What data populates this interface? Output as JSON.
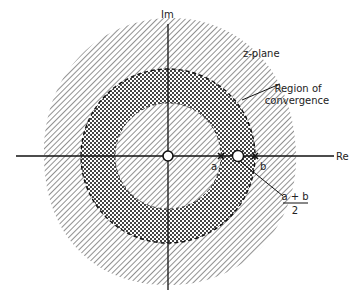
{
  "diagram": {
    "plane_label": "z-plane",
    "axis_labels": {
      "imag": "Im",
      "real": "Re"
    },
    "region_label_line1": "Region of",
    "region_label_line2": "convergence",
    "point_a": "a",
    "point_b": "b",
    "midpoint_numerator": "a + b",
    "midpoint_denominator": "2",
    "regions": [
      {
        "name": "inner-disk",
        "pattern": "diagonal-hatch",
        "radius_label": "a"
      },
      {
        "name": "annulus",
        "pattern": "crosshatch",
        "boundary": "dashed",
        "between": [
          "a",
          "b"
        ]
      },
      {
        "name": "outer-region",
        "pattern": "diagonal-hatch"
      }
    ],
    "markers": [
      {
        "type": "zero",
        "symbol": "o",
        "at": "origin"
      },
      {
        "type": "pole",
        "symbol": "x",
        "at": "a"
      },
      {
        "type": "pole",
        "symbol": "x",
        "at": "b"
      },
      {
        "type": "zero",
        "symbol": "o",
        "at": "(a+b)/2"
      }
    ]
  }
}
